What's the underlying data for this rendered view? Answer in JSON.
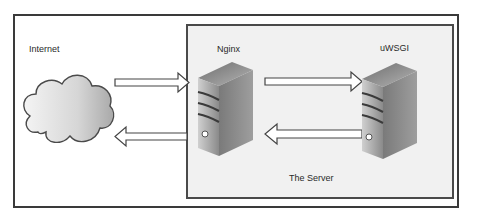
{
  "diagram": {
    "nodes": [
      {
        "id": "internet",
        "label": "Internet",
        "shape": "cloud-icon"
      },
      {
        "id": "nginx",
        "label": "Nginx",
        "shape": "server-tower-icon"
      },
      {
        "id": "uwsgi",
        "label": "uWSGI",
        "shape": "server-tower-icon"
      }
    ],
    "groups": [
      {
        "id": "server",
        "label": "The Server",
        "contains": [
          "nginx",
          "uwsgi"
        ]
      }
    ],
    "edges": [
      {
        "from": "internet",
        "to": "nginx",
        "direction": "right"
      },
      {
        "from": "nginx",
        "to": "internet",
        "direction": "left"
      },
      {
        "from": "nginx",
        "to": "uwsgi",
        "direction": "right"
      },
      {
        "from": "uwsgi",
        "to": "nginx",
        "direction": "left"
      }
    ],
    "colors": {
      "frame": "#3a3a3a",
      "server_group_fill": "#f1f1f1",
      "arrow_stroke": "#444444",
      "arrow_fill": "#ffffff"
    }
  },
  "labels": {
    "internet": "Internet",
    "nginx": "Nginx",
    "uwsgi": "uWSGI",
    "server_group": "The Server"
  }
}
